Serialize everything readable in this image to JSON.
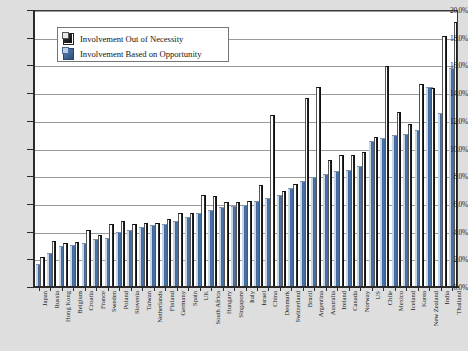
{
  "chart_data": {
    "type": "bar",
    "title": "",
    "xlabel": "",
    "ylabel": "",
    "ylim": [
      0,
      0.2
    ],
    "grid": true,
    "legend_position": "top-left",
    "y_tick_labels": [
      "0.0%",
      "2.0%",
      "4.0%",
      "6.0%",
      "8.0%",
      "10.0%",
      "12.0%",
      "14.0%",
      "16.0%",
      "18.0%",
      "20.0%"
    ],
    "y_tick_values": [
      0.0,
      2.0,
      4.0,
      6.0,
      8.0,
      10.0,
      12.0,
      14.0,
      16.0,
      18.0,
      20.0
    ],
    "categories": [
      "Japan",
      "Russia",
      "Hong Kong",
      "Belgium",
      "Croatia",
      "France",
      "Sweden",
      "Poland",
      "Slovenia",
      "Taiwan",
      "Netherlands",
      "Finland",
      "Germany",
      "Spain",
      "UK",
      "South Africa",
      "Hungary",
      "Singapore",
      "Italy",
      "Israel",
      "China",
      "Denmark",
      "Switzerland",
      "Brazil",
      "Argentina",
      "Australia",
      "Ireland",
      "Canada",
      "Norway",
      "US",
      "Chile",
      "Mexico",
      "Iceland",
      "Korea",
      "New Zealand",
      "India",
      "Thailand"
    ],
    "series": [
      {
        "name": "Involvement Based on Opportunity",
        "color": "#3f6596",
        "values": [
          1.5,
          2.3,
          2.8,
          2.9,
          3.0,
          3.3,
          3.4,
          3.8,
          4.0,
          4.2,
          4.3,
          4.4,
          4.6,
          4.9,
          5.2,
          5.4,
          5.6,
          5.7,
          5.8,
          6.1,
          6.3,
          6.5,
          7.0,
          7.5,
          7.8,
          8.0,
          8.2,
          8.3,
          8.6,
          10.4,
          10.6,
          10.8,
          10.9,
          11.2,
          14.3,
          12.4,
          15.7
        ]
      },
      {
        "name": "Involvement Out of Necessity",
        "color": "#111111",
        "values": [
          2.0,
          3.2,
          3.0,
          3.1,
          4.0,
          3.6,
          4.4,
          4.6,
          4.4,
          4.5,
          4.5,
          4.8,
          5.2,
          5.2,
          6.5,
          6.4,
          6.0,
          6.0,
          6.1,
          7.2,
          12.3,
          6.8,
          7.3,
          13.5,
          14.3,
          9.0,
          9.4,
          9.4,
          9.6,
          10.7,
          15.8,
          12.5,
          11.6,
          14.5,
          14.2,
          18.0,
          19.0
        ]
      }
    ]
  },
  "legend": {
    "items": [
      {
        "label": "Involvement Out of Necessity",
        "swatch": "necessity-swatch"
      },
      {
        "label": "Involvement Based on Opportunity",
        "swatch": "opportunity-swatch"
      }
    ]
  }
}
